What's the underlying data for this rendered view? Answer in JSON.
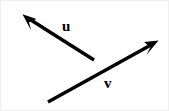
{
  "figure": {
    "type": "vector-diagram",
    "width": 169,
    "height": 111,
    "background_color": "#ffffff",
    "border_color": "#f0f0f0",
    "stroke_color": "#000000",
    "label_color": "#000000"
  },
  "vectors": [
    {
      "id": "u",
      "label": "u",
      "tail": {
        "x": 93,
        "y": 59
      },
      "tip": {
        "x": 22,
        "y": 14
      },
      "direction": "up-left",
      "line_width": 3.4,
      "arrowhead": "filled-triangle",
      "label_position": {
        "x": 61,
        "y": 18
      }
    },
    {
      "id": "v",
      "label": "v",
      "tail": {
        "x": 47,
        "y": 101
      },
      "tip": {
        "x": 157,
        "y": 40
      },
      "direction": "up-right",
      "line_width": 3.4,
      "arrowhead": "filled-triangle",
      "label_position": {
        "x": 103,
        "y": 75
      }
    }
  ]
}
